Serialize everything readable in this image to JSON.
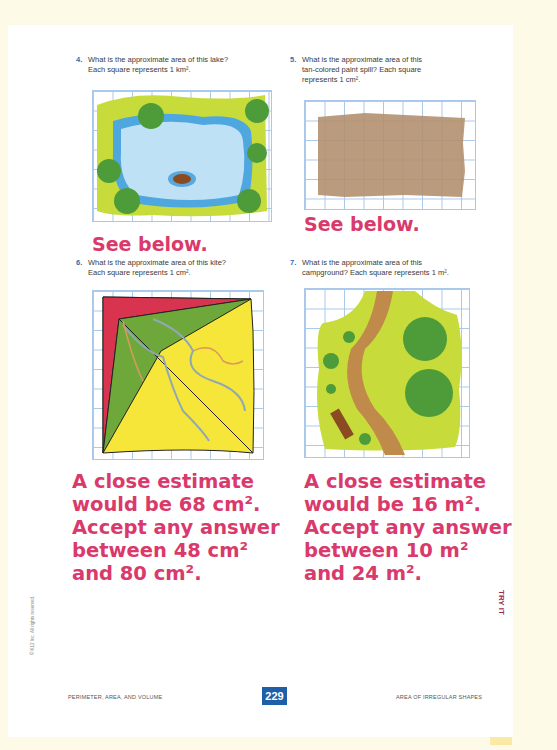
{
  "page": {
    "number": "229",
    "footer_left": "PERIMETER, AREA, AND VOLUME",
    "footer_right": "AREA OF IRREGULAR SHAPES",
    "side_tab": "TRY IT",
    "copyright": "© K12 Inc. All rights reserved."
  },
  "colors": {
    "answer": "#d93a6b",
    "number": "#2f6db3",
    "page_badge": "#1f5fa8",
    "band": "#fbe9a6"
  },
  "questions": [
    {
      "num": "4.",
      "text_l1": "What is the approximate area of this lake?",
      "text_l2": "Each square represents 1 km²."
    },
    {
      "num": "5.",
      "text_l1": "What is the approximate area of this",
      "text_l2": "tan-colored paint spill? Each square",
      "text_l3": "represents 1 cm²."
    },
    {
      "num": "6.",
      "text_l1": "What is the approximate area of this kite?",
      "text_l2": "Each square represents 1 cm²."
    },
    {
      "num": "7.",
      "text_l1": "What is the approximate area of this",
      "text_l2": "campground? Each square represents 1 m²."
    }
  ],
  "answers": {
    "q4": "See below.",
    "q5": "See below.",
    "q6": [
      "A close estimate",
      "would be 68 cm².",
      "Accept any answer",
      "between 48 cm²",
      "and 80 cm²."
    ],
    "q7": [
      "A close estimate",
      "would be 16 m².",
      "Accept any answer",
      "between 10 m²",
      "and 24 m²."
    ]
  }
}
